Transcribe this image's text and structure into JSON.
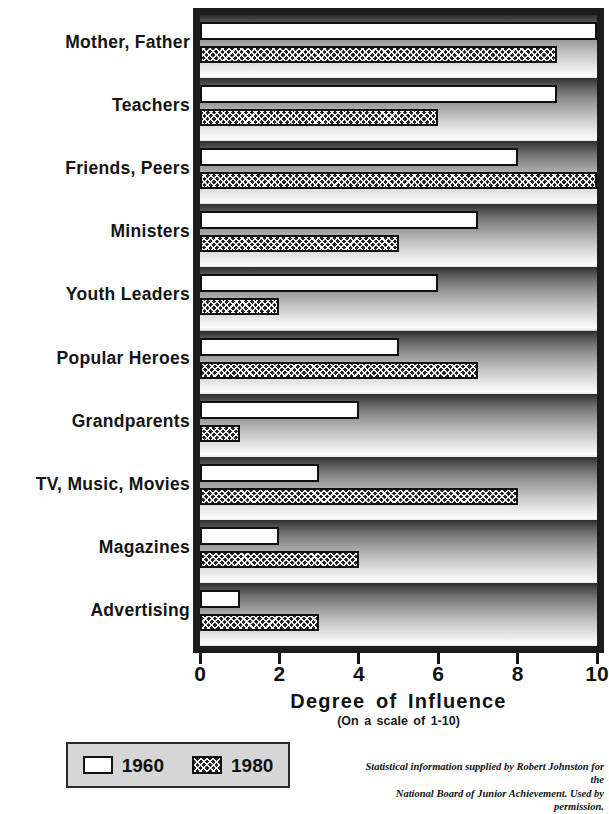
{
  "chart_data": {
    "type": "bar",
    "orientation": "horizontal",
    "title": "",
    "xlabel": "Degree of Influence",
    "xsublabel": "(On a scale of 1-10)",
    "ylabel": "",
    "xlim": [
      0,
      10
    ],
    "xticks": [
      0,
      2,
      4,
      6,
      8,
      10
    ],
    "xtick_labels": [
      "0",
      "2",
      "4",
      "6",
      "8",
      "10"
    ],
    "grid": false,
    "legend_position": "below-left",
    "categories": [
      "Mother, Father",
      "Teachers",
      "Friends, Peers",
      "Ministers",
      "Youth Leaders",
      "Popular Heroes",
      "Grandparents",
      "TV, Music, Movies",
      "Magazines",
      "Advertising"
    ],
    "series": [
      {
        "name": "1960",
        "swatch": "white-solid",
        "color": "#ffffff",
        "values": [
          10,
          9,
          8,
          7,
          6,
          5,
          4,
          3,
          2,
          1
        ]
      },
      {
        "name": "1980",
        "swatch": "dark-crosshatch",
        "color": "#242424",
        "values": [
          9,
          6,
          10,
          5,
          2,
          7,
          1,
          8,
          4,
          3
        ]
      }
    ]
  },
  "legend": {
    "items": [
      {
        "label": "1960",
        "style": "white-solid"
      },
      {
        "label": "1980",
        "style": "dark-crosshatch"
      }
    ]
  },
  "credit": {
    "line1": "Statistical information supplied by Robert Johnston for the",
    "line2": "National Board of Junior Achievement. Used by permission."
  },
  "colors": {
    "frame": "#1c1c1c",
    "bar_1960": "#ffffff",
    "bar_1980": "#242424",
    "legend_bg": "#d6d6d6",
    "text": "#111111"
  }
}
